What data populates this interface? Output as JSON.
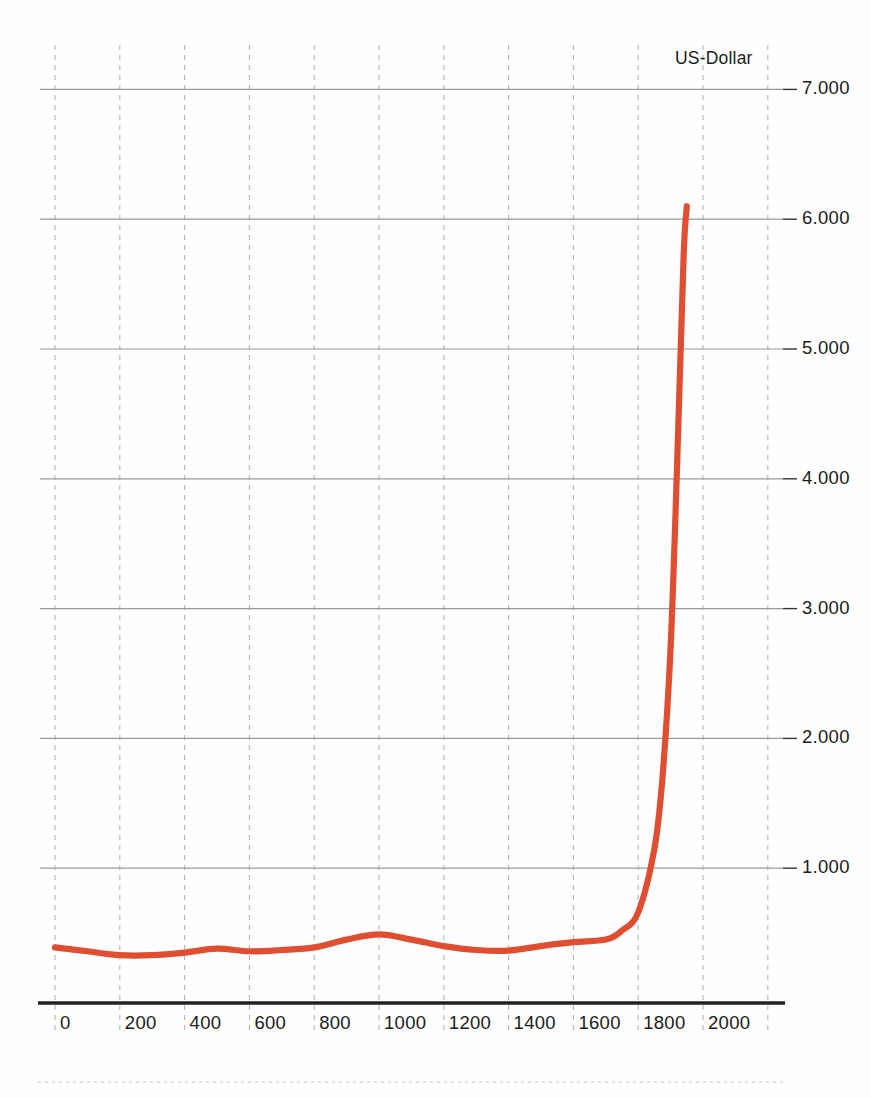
{
  "chart_data": {
    "type": "line",
    "title": "",
    "subtitle": "",
    "xlabel": "",
    "ylabel": "US-Dollar",
    "unit_label": "US-Dollar",
    "grid": true,
    "legend": null,
    "legend_position": "none",
    "series_color": "#E04E31",
    "axis_color": "#222222",
    "gridline_color_horizontal": "#9a9a9a",
    "gridline_color_vertical": "#b5b5b5",
    "xlim": [
      0,
      2200
    ],
    "ylim": [
      0,
      7000
    ],
    "xticks": [
      0,
      200,
      400,
      600,
      800,
      1000,
      1200,
      1400,
      1600,
      1800,
      2000
    ],
    "xtick_labels": [
      "0",
      "200",
      "400",
      "600",
      "800",
      "1000",
      "1200",
      "1400",
      "1600",
      "1800",
      "2000"
    ],
    "yticks": [
      1000,
      2000,
      3000,
      4000,
      5000,
      6000,
      7000
    ],
    "ytick_labels": [
      "1.000",
      "2.000",
      "3.000",
      "4.000",
      "5.000",
      "6.000",
      "7.000"
    ],
    "series": [
      {
        "name": "US-Dollar",
        "x": [
          0,
          100,
          200,
          300,
          400,
          500,
          600,
          700,
          800,
          900,
          1000,
          1100,
          1200,
          1300,
          1400,
          1500,
          1600,
          1700,
          1750,
          1800,
          1850,
          1875,
          1900,
          1920,
          1940,
          1950
        ],
        "values": [
          390,
          360,
          330,
          330,
          350,
          380,
          360,
          370,
          390,
          450,
          490,
          450,
          400,
          370,
          365,
          400,
          430,
          450,
          520,
          660,
          1150,
          1700,
          2700,
          4100,
          5700,
          6100
        ]
      }
    ],
    "annotations": []
  },
  "figure": {
    "unit_label": "US-Dollar"
  }
}
